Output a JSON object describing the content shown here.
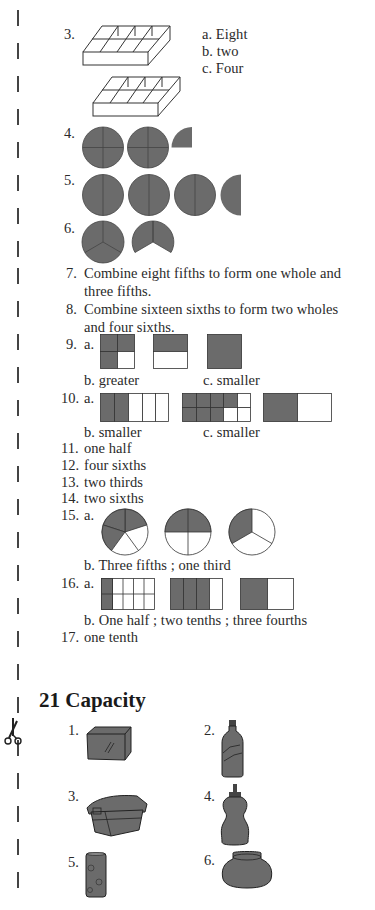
{
  "section20": {
    "q3": {
      "num": "3.",
      "a": "a.  Eight",
      "b": "b.  two",
      "c": "c.  Four"
    },
    "q4": {
      "num": "4."
    },
    "q5": {
      "num": "5."
    },
    "q6": {
      "num": "6."
    },
    "q7": {
      "num": "7.",
      "line1": "Combine eight fifths to form one whole and",
      "line2": "three fifths."
    },
    "q8": {
      "num": "8.",
      "line1": "Combine sixteen sixths to form two wholes",
      "line2": "and four sixths."
    },
    "q9": {
      "num": "9.",
      "a": "a.",
      "b": "b.  greater",
      "c": "c.  smaller"
    },
    "q10": {
      "num": "10.",
      "a": "a.",
      "b": "b.  smaller",
      "c": "c.  smaller"
    },
    "q11": {
      "num": "11.",
      "text": "one half"
    },
    "q12": {
      "num": "12.",
      "text": "four sixths"
    },
    "q13": {
      "num": "13.",
      "text": "two thirds"
    },
    "q14": {
      "num": "14.",
      "text": "two sixths"
    },
    "q15": {
      "num": "15.",
      "a": "a.",
      "b": "b.  Three fifths ; one third"
    },
    "q16": {
      "num": "16.",
      "a": "a.",
      "b": "b.  One half ; two tenths ; three fourths"
    },
    "q17": {
      "num": "17.",
      "text": "one tenth"
    }
  },
  "section21": {
    "title": "21  Capacity",
    "items": [
      {
        "num": "1.",
        "icon": "glass-tank"
      },
      {
        "num": "2.",
        "icon": "soda-bottle"
      },
      {
        "num": "3.",
        "icon": "lidded-container"
      },
      {
        "num": "4.",
        "icon": "squeeze-bottle"
      },
      {
        "num": "5.",
        "icon": "drinking-glass"
      },
      {
        "num": "6.",
        "icon": "pot-jar"
      }
    ]
  },
  "colors": {
    "shade": "#6b6b6b",
    "text": "#2a2a2a"
  }
}
